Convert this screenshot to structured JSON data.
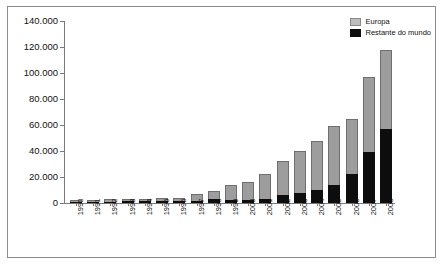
{
  "chart_data": {
    "type": "bar",
    "stacked": true,
    "title": "",
    "subtitle": "",
    "xlabel": "",
    "ylabel": "",
    "ylim": [
      0,
      140000
    ],
    "ytick_labels": [
      "140.000",
      "120.000",
      "100.000",
      "80.000",
      "60.000",
      "40.000",
      "20.000",
      "0"
    ],
    "ytick_values": [
      140000,
      120000,
      100000,
      80000,
      60000,
      40000,
      20000,
      0
    ],
    "grid": false,
    "legend_position": "top-right",
    "categories": [
      "1990",
      "1991",
      "1992",
      "1993",
      "1994",
      "1995",
      "1996",
      "1997",
      "1998",
      "1999",
      "2000",
      "2001",
      "2002",
      "2003",
      "2004",
      "2005",
      "2006",
      "2007",
      "2008"
    ],
    "series": [
      {
        "name": "Europa",
        "color": "#9d9d9d",
        "values": [
          1200,
          1100,
          1700,
          1600,
          1600,
          2400,
          2800,
          5200,
          6000,
          11500,
          13500,
          19000,
          26000,
          32000,
          38000,
          45000,
          43000,
          58000,
          61000
        ]
      },
      {
        "name": "Restante do mundo",
        "color": "#0d0d0d",
        "values": [
          1000,
          900,
          1000,
          1200,
          1200,
          1200,
          1300,
          1500,
          3200,
          2500,
          2500,
          3000,
          6000,
          8000,
          10000,
          14000,
          22000,
          39000,
          57000
        ]
      }
    ],
    "totals": [
      2200,
      2000,
      2700,
      2800,
      2800,
      3600,
      4100,
      6700,
      9200,
      14000,
      16000,
      22000,
      32000,
      40000,
      48000,
      59000,
      65000,
      97000,
      118000
    ]
  },
  "legend": {
    "items": [
      {
        "label": "Europa",
        "color": "#9d9d9d"
      },
      {
        "label": "Restante do mundo",
        "color": "#0d0d0d"
      }
    ]
  }
}
